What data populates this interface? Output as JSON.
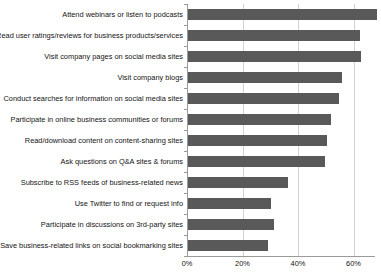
{
  "chart_data": {
    "type": "bar",
    "orientation": "horizontal",
    "title": "",
    "xlabel": "",
    "ylabel": "",
    "xlim": [
      0,
      68
    ],
    "grid": true,
    "legend": false,
    "xticks": [
      "0%",
      "20%",
      "40%",
      "60%"
    ],
    "xtick_values": [
      0,
      20,
      40,
      60
    ],
    "bar_color": "#595959",
    "gridline_color": "#d2d2d2",
    "axis_color": "#9a9a9a",
    "categories": [
      "Attend webinars or listen to podcasts",
      "Read user ratings/reviews for business products/services",
      "Visit company pages on social media sites",
      "Visit company blogs",
      "Conduct searches for information on social media sites",
      "Participate in online business communities or forums",
      "Read/download content on content-sharing sites",
      "Ask questions on Q&A sites & forums",
      "Subscribe to RSS feeds of business-related news",
      "Use Twitter to find or request info",
      "Participate in discussions on 3rd-party sites",
      "Save business-related links on social bookmarking sites"
    ],
    "values": [
      68,
      62,
      62.5,
      55.5,
      54.5,
      51.5,
      50,
      49.5,
      36,
      30,
      31,
      29
    ]
  }
}
